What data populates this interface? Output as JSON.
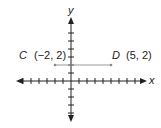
{
  "diagram": {
    "type": "coordinate-plane",
    "x_axis_label": "x",
    "y_axis_label": "y",
    "x_range": [
      -7,
      8
    ],
    "y_range": [
      -5,
      6
    ],
    "points": [
      {
        "name": "C",
        "coords_label": "(−2, 2)",
        "x": -2,
        "y": 2
      },
      {
        "name": "D",
        "coords_label": "(5, 2)",
        "x": 5,
        "y": 2
      }
    ],
    "segment": {
      "from": "C",
      "to": "D"
    },
    "colors": {
      "axis": "#222222",
      "segment": "#999999"
    }
  }
}
